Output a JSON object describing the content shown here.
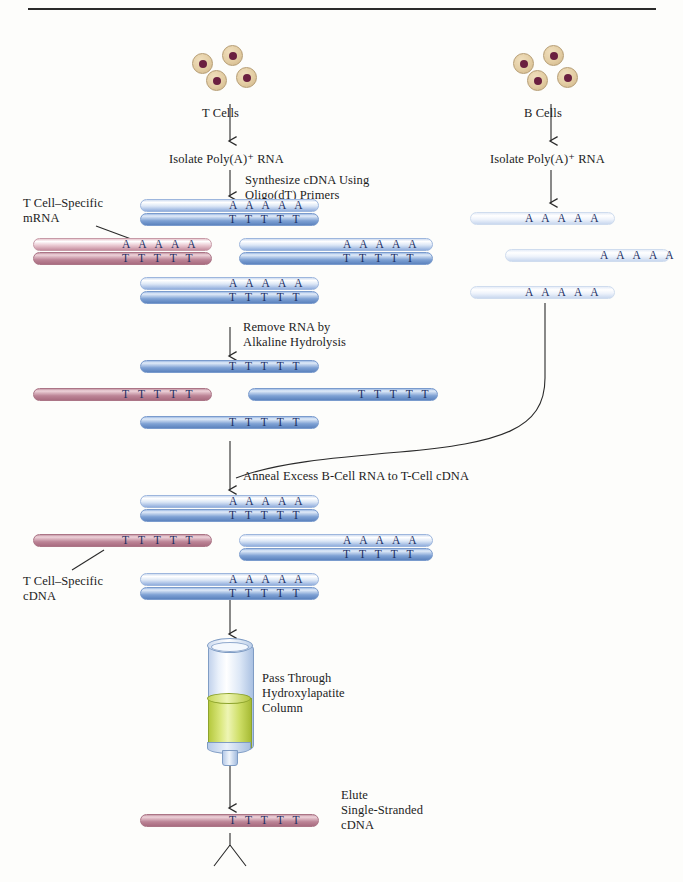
{
  "figure": {
    "title_rule": true,
    "background": "#fdfdfb"
  },
  "colors": {
    "cell_body": "#e3cda3",
    "cell_nucleus": "#6b2040",
    "cdna_blue": "#5c83be",
    "rna_light_blue": "#dce7f6",
    "tcell_specific_pink": "#bc8496",
    "column_media": "#cfdf68",
    "base_text": "#1b2f63",
    "line": "#2a2a2a"
  },
  "columns": {
    "left": {
      "cells_label": "T Cells",
      "step1": "Isolate Poly(A)⁺ RNA",
      "step2": "Synthesize cDNA Using\nOligo(dT) Primers",
      "step3": "Remove RNA  by\nAlkaline Hydrolysis",
      "step4": "Anneal Excess B-Cell RNA to T-Cell cDNA",
      "step5": "Pass Through\nHydroxylapatite\nColumn",
      "step6": "Elute\nSingle-Stranded\ncDNA"
    },
    "right": {
      "cells_label": "B Cells",
      "step1": "Isolate Poly(A)⁺ RNA"
    }
  },
  "callouts": {
    "mrna": "T Cell–Specific\nmRNA",
    "cdna": "T Cell–Specific\ncDNA"
  },
  "bases": {
    "a_run": "A A A A A",
    "t_run": "T T T T T"
  },
  "rows": {
    "after_synthesis": [
      {
        "kind": "duplex",
        "color": "blue",
        "x": 140,
        "y": 199,
        "w": 179,
        "top_bases": "A A A A A",
        "bottom_bases": "T T T T T",
        "bases_x": 89
      },
      {
        "kind": "duplex",
        "color": "pink",
        "x": 33,
        "y": 238,
        "w": 179,
        "top_bases": "A A A A A",
        "bottom_bases": "T T T T T",
        "bases_x": 89,
        "callout": "mrna"
      },
      {
        "kind": "duplex",
        "color": "blue",
        "x": 239,
        "y": 238,
        "w": 194,
        "top_bases": "A A A A A",
        "bottom_bases": "T T T T T",
        "bases_x": 104
      },
      {
        "kind": "duplex",
        "color": "blue",
        "x": 140,
        "y": 277,
        "w": 179,
        "top_bases": "A A A A A",
        "bottom_bases": "T T T T T",
        "bases_x": 89
      }
    ],
    "b_cell_rna": [
      {
        "kind": "single",
        "color": "lightblue",
        "x": 470,
        "y": 212,
        "w": 145,
        "bases": "A A A A A",
        "bases_x": 55
      },
      {
        "kind": "single",
        "color": "lightblue",
        "x": 505,
        "y": 249,
        "w": 165,
        "bases": "A A A A A",
        "bases_x": 95
      },
      {
        "kind": "single",
        "color": "lightblue",
        "x": 470,
        "y": 286,
        "w": 145,
        "bases": "A A A A A",
        "bases_x": 55
      }
    ],
    "after_hydrolysis": [
      {
        "kind": "single",
        "color": "blue",
        "x": 140,
        "y": 360,
        "w": 179,
        "bases": "T T T T T",
        "bases_x": 89
      },
      {
        "kind": "single",
        "color": "pink",
        "x": 33,
        "y": 388,
        "w": 179,
        "bases": "T T T T T",
        "bases_x": 89
      },
      {
        "kind": "single",
        "color": "blue",
        "x": 248,
        "y": 388,
        "w": 190,
        "bases": "T T T T T",
        "bases_x": 110
      },
      {
        "kind": "single",
        "color": "blue",
        "x": 140,
        "y": 416,
        "w": 179,
        "bases": "T T T T T",
        "bases_x": 89
      }
    ],
    "after_anneal": [
      {
        "kind": "duplex",
        "color": "blue",
        "x": 140,
        "y": 495,
        "w": 179,
        "top_bases": "A A A A A",
        "bottom_bases": "T T T T T",
        "bases_x": 89
      },
      {
        "kind": "single",
        "color": "pink",
        "x": 33,
        "y": 534,
        "w": 179,
        "bases": "T T T T T",
        "bases_x": 89,
        "callout": "cdna"
      },
      {
        "kind": "duplex",
        "color": "blue",
        "x": 239,
        "y": 534,
        "w": 194,
        "top_bases": "A A A A A",
        "bottom_bases": "T T T T T",
        "bases_x": 104
      },
      {
        "kind": "duplex",
        "color": "blue",
        "x": 140,
        "y": 573,
        "w": 179,
        "top_bases": "A A A A A",
        "bottom_bases": "T T T T T",
        "bases_x": 89
      }
    ],
    "eluted": [
      {
        "kind": "single",
        "color": "pink",
        "x": 140,
        "y": 814,
        "w": 179,
        "bases": "T T T T T",
        "bases_x": 89
      }
    ]
  }
}
